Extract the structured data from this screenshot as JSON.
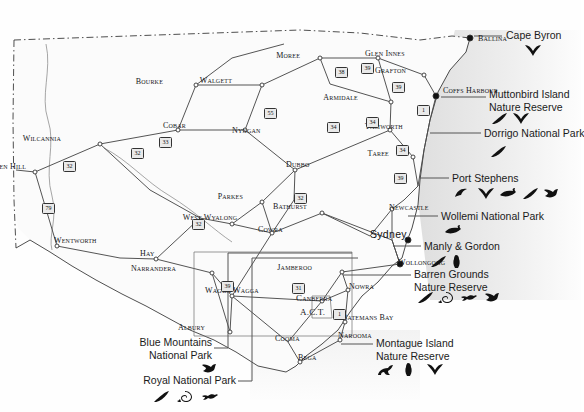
{
  "meta": {
    "canvas": {
      "width": 581,
      "height": 412
    },
    "colors": {
      "land": "#fbfbfb",
      "sea": "#e8e8e8",
      "border": "#3a3a3a",
      "road": "#4a4a4a",
      "text": "#1b1b1b",
      "leader": "#555555",
      "icon": "#111111"
    }
  },
  "map": {
    "towns": [
      {
        "name": "Ballina",
        "x": 470,
        "y": 38,
        "style": "town",
        "align": "left",
        "dot": "filled",
        "dx": 478,
        "dy": 40
      },
      {
        "name": "Moree",
        "x": 320,
        "y": 58,
        "style": "town",
        "align": "right",
        "dot": "hollow",
        "dx": 300,
        "dy": 57
      },
      {
        "name": "Glen Innes",
        "x": 378,
        "y": 58,
        "style": "town",
        "align": "left",
        "dot": "hollow",
        "dx": 365,
        "dy": 55
      },
      {
        "name": "Grafton",
        "x": 424,
        "y": 75,
        "style": "town",
        "align": "right",
        "dot": "hollow",
        "dx": 406,
        "dy": 72
      },
      {
        "name": "Coffs Harbour",
        "x": 436,
        "y": 96,
        "style": "town",
        "align": "left",
        "dot": "filled",
        "dx": 443,
        "dy": 92
      },
      {
        "name": "Bourke",
        "x": 196,
        "y": 85,
        "style": "town",
        "align": "right",
        "dot": "hollow",
        "dx": 163,
        "dy": 83
      },
      {
        "name": "Walgett",
        "x": 262,
        "y": 85,
        "style": "town",
        "align": "right",
        "dot": "hollow",
        "dx": 232,
        "dy": 82
      },
      {
        "name": "Armidale",
        "x": 391,
        "y": 102,
        "style": "town",
        "align": "right",
        "dot": "hollow",
        "dx": 358,
        "dy": 99
      },
      {
        "name": "Wilcannia",
        "x": 100,
        "y": 144,
        "style": "town",
        "align": "right",
        "dot": "hollow",
        "dx": 61,
        "dy": 140
      },
      {
        "name": "Cobar",
        "x": 178,
        "y": 130,
        "style": "town",
        "align": "right",
        "dot": "hollow",
        "dx": 186,
        "dy": 127
      },
      {
        "name": "Nyngan",
        "x": 245,
        "y": 130,
        "style": "town",
        "align": "left",
        "dot": "hollow",
        "dx": 232,
        "dy": 132
      },
      {
        "name": "Tamworth",
        "x": 390,
        "y": 130,
        "style": "town",
        "align": "left",
        "dot": "hollow",
        "dx": 365,
        "dy": 128
      },
      {
        "name": "Taree",
        "x": 413,
        "y": 157,
        "style": "town",
        "align": "right",
        "dot": "hollow",
        "dx": 389,
        "dy": 155
      },
      {
        "name": "Broken Hill",
        "x": 35,
        "y": 172,
        "style": "town",
        "align": "right",
        "dot": "hollow",
        "dx": 26,
        "dy": 168
      },
      {
        "name": "Dubbo",
        "x": 295,
        "y": 170,
        "style": "town",
        "align": "left",
        "dot": "hollow",
        "dx": 286,
        "dy": 166
      },
      {
        "name": "Parkes",
        "x": 262,
        "y": 202,
        "style": "town",
        "align": "right",
        "dot": "hollow",
        "dx": 243,
        "dy": 198
      },
      {
        "name": "Bathurst",
        "x": 322,
        "y": 213,
        "style": "town",
        "align": "right",
        "dot": "hollow",
        "dx": 307,
        "dy": 208
      },
      {
        "name": "Newcastle",
        "x": 392,
        "y": 209,
        "style": "town",
        "align": "left",
        "dot": "hollow",
        "dx": 389,
        "dy": 209
      },
      {
        "name": "Wentworth",
        "x": 57,
        "y": 246,
        "style": "town",
        "align": "left",
        "dot": "hollow",
        "dx": 54,
        "dy": 242
      },
      {
        "name": "West Wyalong",
        "x": 232,
        "y": 224,
        "style": "town",
        "align": "center",
        "dot": "hollow",
        "dx": 210,
        "dy": 219
      },
      {
        "name": "Cowra",
        "x": 272,
        "y": 233,
        "style": "town",
        "align": "left",
        "dot": "hollow",
        "dx": 258,
        "dy": 231
      },
      {
        "name": "Sydney",
        "x": 408,
        "y": 240,
        "style": "big",
        "align": "left",
        "dot": "filled",
        "dx": 370,
        "dy": 234
      },
      {
        "name": "Hay",
        "x": 156,
        "y": 259,
        "style": "town",
        "align": "left",
        "dot": "hollow",
        "dx": 140,
        "dy": 255
      },
      {
        "name": "Narrandera",
        "x": 212,
        "y": 273,
        "style": "town",
        "align": "right",
        "dot": "hollow",
        "dx": 176,
        "dy": 270
      },
      {
        "name": "Wollongong",
        "x": 400,
        "y": 264,
        "style": "town",
        "align": "left",
        "dot": "filled",
        "dx": 398,
        "dy": 264
      },
      {
        "name": "Jamberoo",
        "x": 342,
        "y": 272,
        "style": "town",
        "align": "right",
        "dot": "hollow",
        "dx": 312,
        "dy": 269
      },
      {
        "name": "Nowra",
        "x": 348,
        "y": 290,
        "style": "town",
        "align": "left",
        "dot": "hollow",
        "dx": 349,
        "dy": 288
      },
      {
        "name": "Wagga Wagga",
        "x": 232,
        "y": 296,
        "style": "town",
        "align": "center",
        "dot": "hollow",
        "dx": 232,
        "dy": 292
      },
      {
        "name": "Canberra",
        "x": 322,
        "y": 301,
        "style": "mid",
        "align": "left",
        "dot": "hollow",
        "dx": 296,
        "dy": 299
      },
      {
        "name": "A.C.T.",
        "x": 0,
        "y": 0,
        "style": "mid",
        "align": "left",
        "dot": "none",
        "dx": 300,
        "dy": 313
      },
      {
        "name": "Albury",
        "x": 230,
        "y": 332,
        "style": "town",
        "align": "right",
        "dot": "hollow",
        "dx": 205,
        "dy": 329
      },
      {
        "name": "Batemans Bay",
        "x": 345,
        "y": 322,
        "style": "town",
        "align": "left",
        "dot": "hollow",
        "dx": 342,
        "dy": 319
      },
      {
        "name": "Cooma",
        "x": 288,
        "y": 342,
        "style": "town",
        "align": "left",
        "dot": "none",
        "dx": 275,
        "dy": 340
      },
      {
        "name": "Narooma",
        "x": 340,
        "y": 340,
        "style": "town",
        "align": "left",
        "dot": "hollow",
        "dx": 338,
        "dy": 337
      },
      {
        "name": "Bega",
        "x": 300,
        "y": 362,
        "style": "town",
        "align": "left",
        "dot": "hollow",
        "dx": 298,
        "dy": 359
      }
    ],
    "route_shields": [
      {
        "label": "39",
        "x": 361,
        "y": 63
      },
      {
        "label": "38",
        "x": 335,
        "y": 67
      },
      {
        "label": "55",
        "x": 264,
        "y": 108
      },
      {
        "label": "39",
        "x": 392,
        "y": 82
      },
      {
        "label": "34",
        "x": 366,
        "y": 117
      },
      {
        "label": "1",
        "x": 417,
        "y": 105
      },
      {
        "label": "34",
        "x": 327,
        "y": 122
      },
      {
        "label": "34",
        "x": 396,
        "y": 145
      },
      {
        "label": "33",
        "x": 159,
        "y": 137
      },
      {
        "label": "32",
        "x": 131,
        "y": 148
      },
      {
        "label": "32",
        "x": 63,
        "y": 161
      },
      {
        "label": "79",
        "x": 42,
        "y": 203
      },
      {
        "label": "32",
        "x": 294,
        "y": 193
      },
      {
        "label": "39",
        "x": 394,
        "y": 173
      },
      {
        "label": "32",
        "x": 192,
        "y": 219
      },
      {
        "label": "39",
        "x": 221,
        "y": 281
      },
      {
        "label": "31",
        "x": 292,
        "y": 283
      },
      {
        "label": "1",
        "x": 333,
        "y": 309
      }
    ]
  },
  "annotations": [
    {
      "id": "cape-byron",
      "lines": [
        "Cape Byron"
      ],
      "text_x": 506,
      "text_y": 29,
      "align": "left",
      "leader": {
        "x1": 474,
        "y1": 36,
        "x2": 502,
        "y2": 36
      },
      "icons": [
        {
          "name": "whale-tail-icon",
          "x": 524,
          "y": 44
        }
      ]
    },
    {
      "id": "muttonbird-island-nature-reserve",
      "lines": [
        "Muttonbird Island",
        "Nature Reserve"
      ],
      "text_x": 489,
      "text_y": 88,
      "align": "left",
      "leader": {
        "x1": 441,
        "y1": 97,
        "x2": 486,
        "y2": 97
      },
      "icons": [
        {
          "name": "feather-icon",
          "x": 490,
          "y": 112
        },
        {
          "name": "whale-tail-icon",
          "x": 512,
          "y": 112
        }
      ]
    },
    {
      "id": "dorrigo-national-park",
      "lines": [
        "Dorrigo National Park"
      ],
      "text_x": 484,
      "text_y": 127,
      "align": "left",
      "leader": {
        "x1": 430,
        "y1": 133,
        "x2": 481,
        "y2": 133
      },
      "icons": [
        {
          "name": "feather-icon",
          "x": 489,
          "y": 145
        }
      ]
    },
    {
      "id": "port-stephens",
      "lines": [
        "Port Stephens"
      ],
      "text_x": 452,
      "text_y": 172,
      "align": "left",
      "leader": {
        "x1": 420,
        "y1": 178,
        "x2": 449,
        "y2": 178
      },
      "icons": [
        {
          "name": "dolphin-fin-icon",
          "x": 454,
          "y": 187
        },
        {
          "name": "whale-tail-icon",
          "x": 477,
          "y": 187
        },
        {
          "name": "dolphin-icon",
          "x": 499,
          "y": 187
        },
        {
          "name": "feather-icon",
          "x": 521,
          "y": 187
        },
        {
          "name": "bird-icon",
          "x": 542,
          "y": 187
        }
      ]
    },
    {
      "id": "wollemi-national-park",
      "lines": [
        "Wollemi National Park"
      ],
      "text_x": 441,
      "text_y": 210,
      "align": "left",
      "leader": {
        "x1": 408,
        "y1": 216,
        "x2": 438,
        "y2": 216
      },
      "icons": [
        {
          "name": "dolphin-icon",
          "x": 444,
          "y": 224
        }
      ]
    },
    {
      "id": "manly-and-gordon",
      "lines": [
        "Manly & Gordon"
      ],
      "text_x": 424,
      "text_y": 240,
      "align": "left",
      "leader": {
        "x1": 393,
        "y1": 246,
        "x2": 421,
        "y2": 246
      },
      "icons": [
        {
          "name": "feather-icon",
          "x": 429,
          "y": 255
        },
        {
          "name": "penguin-icon",
          "x": 452,
          "y": 255
        }
      ]
    },
    {
      "id": "barren-grounds-nature-reserve",
      "lines": [
        "Barren Grounds",
        "Nature Reserve"
      ],
      "text_x": 414,
      "text_y": 268,
      "align": "left",
      "leader": {
        "x1": 343,
        "y1": 275,
        "x2": 411,
        "y2": 275
      },
      "icons": [
        {
          "name": "feather-icon",
          "x": 416,
          "y": 291
        },
        {
          "name": "snail-shell-icon",
          "x": 438,
          "y": 291
        },
        {
          "name": "lizard-icon",
          "x": 460,
          "y": 291
        },
        {
          "name": "bird-icon",
          "x": 483,
          "y": 291
        }
      ]
    },
    {
      "id": "montague-island-nature-reserve",
      "lines": [
        "Montague Island",
        "Nature Reserve"
      ],
      "text_x": 376,
      "text_y": 337,
      "align": "left",
      "leader": {
        "x1": 341,
        "y1": 344,
        "x2": 373,
        "y2": 344
      },
      "icons": [
        {
          "name": "seal-icon",
          "x": 377,
          "y": 363
        },
        {
          "name": "penguin-icon",
          "x": 404,
          "y": 363
        },
        {
          "name": "whale-tail-icon",
          "x": 426,
          "y": 363
        }
      ]
    },
    {
      "id": "blue-mountains-national-park",
      "lines": [
        "Blue Mountains",
        "National Park"
      ],
      "text_x": 212,
      "text_y": 336,
      "align": "right",
      "leader_path": "M214,348 L228,348 L228,253 L352,253",
      "icons": [
        {
          "name": "bird-icon",
          "x": 200,
          "y": 362
        }
      ]
    },
    {
      "id": "royal-national-park",
      "lines": [
        "Royal National Park"
      ],
      "text_x": 236,
      "text_y": 374,
      "align": "right",
      "leader_path": "M238,381 L252,381 L252,258 L358,258",
      "icons": [
        {
          "name": "feather-icon",
          "x": 152,
          "y": 390
        },
        {
          "name": "snail-shell-icon",
          "x": 177,
          "y": 390
        },
        {
          "name": "lizard-icon",
          "x": 201,
          "y": 390
        }
      ]
    }
  ]
}
